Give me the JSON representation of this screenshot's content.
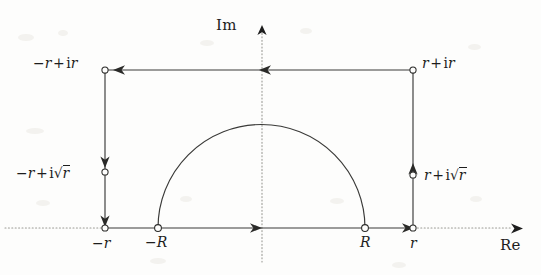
{
  "figure": {
    "type": "complex-plane-contour-diagram",
    "background_color": "#fdfdfc",
    "ink_color": "#1d1d1d",
    "axes": {
      "imaginary": {
        "label": "Im",
        "orientation": "vertical",
        "style": "dotted",
        "arrow": "up",
        "x_px": 262
      },
      "real": {
        "label": "Re",
        "orientation": "horizontal",
        "style": "dotted",
        "arrow": "right",
        "y_px": 228
      }
    },
    "contour": {
      "shape": "rectangle-with-indented-semicircle",
      "direction": "clockwise",
      "rectangle": {
        "left_x": 105,
        "right_x": 413,
        "top_y": 70,
        "bottom_y": 228
      },
      "semicircle": {
        "center_x": 262,
        "center_y": 228,
        "radius": 103,
        "half": "upper"
      }
    },
    "vertices": [
      {
        "name": "top-left",
        "label_parts": {
          "minus": "−",
          "r1": "r",
          "plus": "+",
          "i": "i",
          "r2": "r"
        },
        "x": 105,
        "y": 70
      },
      {
        "name": "top-right",
        "label_parts": {
          "minus": "",
          "r1": "r",
          "plus": "+",
          "i": "i",
          "r2": "r"
        },
        "x": 413,
        "y": 70
      },
      {
        "name": "bottom-left",
        "x": 105,
        "y": 228
      },
      {
        "name": "bottom-right",
        "x": 413,
        "y": 228
      }
    ],
    "labels": {
      "top_left_corner": {
        "text": "−r + ir",
        "x": 33,
        "y": 56
      },
      "top_right_corner": {
        "text": "r + ir",
        "x": 422,
        "y": 56
      },
      "left_mid": {
        "text": "−r + i√r",
        "x": 16,
        "y": 164
      },
      "right_mid": {
        "text": "r + i√r",
        "x": 424,
        "y": 166
      },
      "minus_r_axis": {
        "text": "−r",
        "x": 92,
        "y": 236
      },
      "r_axis": {
        "text": "r",
        "x": 409,
        "y": 236
      },
      "minus_R": {
        "text": "−R",
        "x": 147,
        "y": 236
      },
      "R": {
        "text": "R",
        "x": 359,
        "y": 236
      },
      "im_axis": {
        "text": "Im",
        "x": 216,
        "y": 18
      },
      "re_axis": {
        "text": "Re",
        "x": 500,
        "y": 238
      }
    },
    "label_tokens": {
      "minus": "−",
      "plus": "+",
      "imaginary_unit": "i",
      "radius_small": "r",
      "radius_large": "R",
      "radical": "√"
    },
    "markers": [
      {
        "name": "marker-top-left",
        "x": 105,
        "y": 70,
        "style": "open-circle"
      },
      {
        "name": "marker-top-right",
        "x": 413,
        "y": 70,
        "style": "open-circle"
      },
      {
        "name": "marker-left-mid",
        "x": 105,
        "y": 172,
        "style": "open-circle"
      },
      {
        "name": "marker-right-mid",
        "x": 413,
        "y": 175,
        "style": "open-circle"
      },
      {
        "name": "marker-bottom-left",
        "x": 105,
        "y": 228,
        "style": "open-circle"
      },
      {
        "name": "marker-bottom-right",
        "x": 413,
        "y": 228,
        "style": "open-circle"
      },
      {
        "name": "marker-minus-R",
        "x": 158,
        "y": 228,
        "style": "open-circle"
      },
      {
        "name": "marker-R",
        "x": 365,
        "y": 228,
        "style": "open-circle"
      }
    ],
    "arrows": [
      {
        "name": "arrow-top-edge-right",
        "x": 265,
        "y": 70,
        "direction": "left"
      },
      {
        "name": "arrow-top-edge-left",
        "x": 120,
        "y": 70,
        "direction": "left"
      },
      {
        "name": "arrow-left-edge-upper",
        "x": 105,
        "y": 163,
        "direction": "down"
      },
      {
        "name": "arrow-left-edge-lower",
        "x": 105,
        "y": 221,
        "direction": "down"
      },
      {
        "name": "arrow-bottom-edge",
        "x": 256,
        "y": 228,
        "direction": "right"
      },
      {
        "name": "arrow-right-edge",
        "x": 413,
        "y": 167,
        "direction": "up"
      },
      {
        "name": "arrow-bottom-right-in",
        "x": 408,
        "y": 228,
        "direction": "right"
      },
      {
        "name": "arrow-im-axis",
        "x": 262,
        "y": 28,
        "direction": "up"
      },
      {
        "name": "arrow-re-axis",
        "x": 516,
        "y": 229,
        "direction": "right"
      }
    ]
  }
}
